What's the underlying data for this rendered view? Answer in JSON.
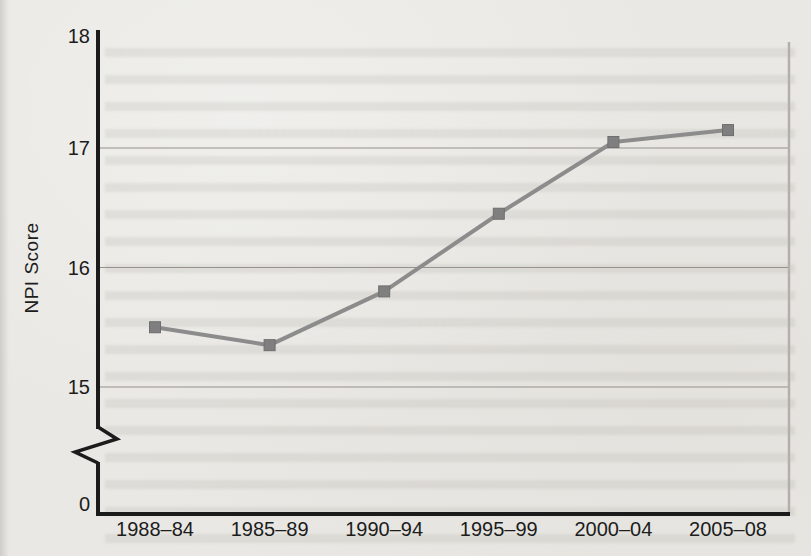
{
  "figure": {
    "background_color": "#e9e8e4",
    "axis_color": "#1b1b1b",
    "grid_color": "#96928b",
    "right_border_color": "#b3b0ab",
    "line_color": "#8c8c8c",
    "marker_color": "#7f7f7f",
    "marker_edge_color": "#6e6e6e",
    "text_color": "#1c1c1c"
  },
  "chart_data": {
    "type": "line",
    "title": "",
    "xlabel": "",
    "ylabel": "NPI Score",
    "categories": [
      "1988–84",
      "1985–89",
      "1990–94",
      "1995–99",
      "2000–04",
      "2005–08"
    ],
    "series": [
      {
        "name": "NPI Score",
        "values": [
          15.5,
          15.35,
          15.8,
          16.45,
          17.05,
          17.15
        ]
      }
    ],
    "y_tick_labels": [
      "18",
      "17",
      "16",
      "15"
    ],
    "y_tick_values": [
      18,
      17,
      16,
      15
    ],
    "grid_tick_values": [
      17,
      16,
      15
    ],
    "axis_break": true,
    "y_break_label": "0",
    "ylim_display": [
      15,
      18
    ],
    "grid": "horizontal",
    "legend": "none",
    "marker": "square"
  }
}
